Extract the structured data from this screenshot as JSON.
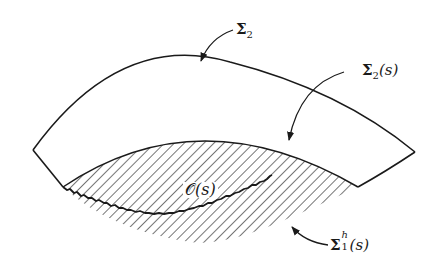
{
  "figure": {
    "type": "geometric-diagram",
    "colors": {
      "stroke": "#1a1a1a",
      "hatch": "#2a2a2a",
      "background": "#ffffff"
    }
  },
  "labels": {
    "sigma2": {
      "symbol": "Σ",
      "subscript": "2",
      "suffix": ""
    },
    "sigma2s": {
      "symbol": "Σ",
      "subscript": "2",
      "suffix": "(s)"
    },
    "sigma1h": {
      "symbol": "Σ",
      "subscript": "1",
      "superscript": "h",
      "suffix": "(s)"
    },
    "region": {
      "symbol": "𝒪",
      "suffix": "(s)"
    }
  },
  "annotations": [
    {
      "target": "outer upper boundary",
      "label": "Σ2"
    },
    {
      "target": "upper boundary of hatched region",
      "label": "Σ2(s)"
    },
    {
      "target": "lower (jagged) boundary of hatched region",
      "label": "Σ1^h(s)"
    },
    {
      "target": "hatched region",
      "label": "O(s)"
    }
  ]
}
